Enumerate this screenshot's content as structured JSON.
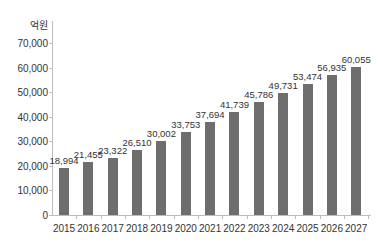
{
  "chart_data": {
    "type": "bar",
    "title": "",
    "unit_label": "억원",
    "xlabel": "",
    "ylabel": "억원",
    "ylim": [
      0,
      70000
    ],
    "grid": false,
    "legend": null,
    "yticks": [
      "0",
      "10,000",
      "20,000",
      "30,000",
      "40,000",
      "50,000",
      "60,000",
      "70,000"
    ],
    "categories": [
      "2015",
      "2016",
      "2017",
      "2018",
      "2019",
      "2020",
      "2021",
      "2022",
      "2023",
      "2024",
      "2025",
      "2026",
      "2027"
    ],
    "values": [
      18994,
      21455,
      23322,
      26510,
      30002,
      33753,
      37694,
      41739,
      45786,
      49731,
      53474,
      56935,
      60055
    ],
    "value_labels": [
      "18,994",
      "21,455",
      "23,322",
      "26,510",
      "30,002",
      "33,753",
      "37,694",
      "41,739",
      "45,786",
      "49,731",
      "53,474",
      "56,935",
      "60,055"
    ],
    "bar_color": "#6e6e6e"
  }
}
